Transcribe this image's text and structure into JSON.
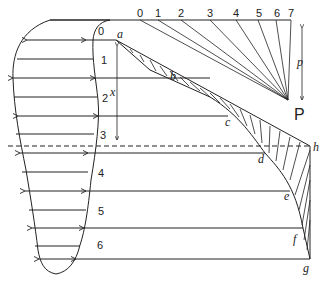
{
  "diagram": {
    "title": "",
    "strip_labels": [
      "0",
      "1",
      "2",
      "3",
      "4",
      "5",
      "6"
    ],
    "force_scale_labels": [
      "0",
      "1",
      "2",
      "3",
      "4",
      "5",
      "6",
      "7"
    ],
    "curve_points": [
      "a",
      "b",
      "c",
      "d",
      "e",
      "f",
      "g"
    ],
    "corner_point": "h",
    "pole_label": "P",
    "force_label": "p",
    "depth_label": "x",
    "colors": {
      "ink": "#222222",
      "background": "#ffffff"
    }
  }
}
